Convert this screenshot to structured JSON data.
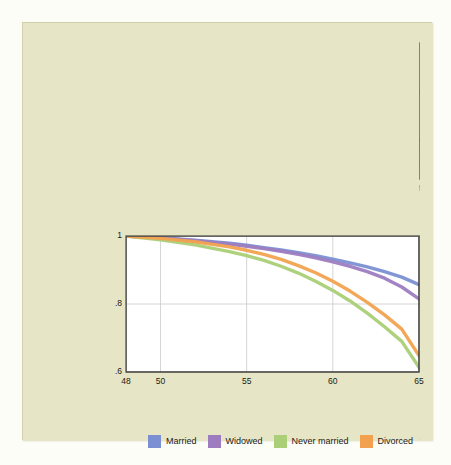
{
  "figure": {
    "background_color": "#e6e5c6",
    "panels": [
      {
        "tag": "(a) Men",
        "ylabel_line1": "Probability",
        "ylabel_line2": "of survival",
        "xlabel": "Age in years"
      },
      {
        "tag": "(b) Women",
        "ylabel_line1": "Probability",
        "ylabel_line2": "of survival",
        "xlabel": "Age in years"
      }
    ]
  },
  "legend": {
    "position": "bottom",
    "items": [
      {
        "label": "Married",
        "color": "#7b8fd2"
      },
      {
        "label": "Widowed",
        "color": "#9d7cc0"
      },
      {
        "label": "Never married",
        "color": "#aacf77"
      },
      {
        "label": "Divorced",
        "color": "#f2a24f"
      }
    ]
  },
  "chart_data": [
    {
      "type": "line",
      "title": "(a) Men",
      "xlabel": "Age in years",
      "ylabel": "Probability of survival",
      "xlim": [
        48,
        65
      ],
      "ylim": [
        0.6,
        1.0
      ],
      "xticks": [
        48,
        50,
        55,
        60,
        65
      ],
      "xtick_labels": [
        "48",
        "50",
        "55",
        "60",
        "65"
      ],
      "yticks": [
        0.6,
        0.8,
        1.0
      ],
      "ytick_labels": [
        ".6",
        ".8",
        "1"
      ],
      "grid": true,
      "x": [
        48,
        50,
        52,
        54,
        55,
        56,
        57,
        58,
        59,
        60,
        61,
        62,
        63,
        64,
        65
      ],
      "series": [
        {
          "name": "Married",
          "color": "#7b8fd2",
          "values": [
            1.0,
            0.994,
            0.986,
            0.975,
            0.968,
            0.96,
            0.952,
            0.943,
            0.933,
            0.922,
            0.91,
            0.897,
            0.884,
            0.871,
            0.859
          ]
        },
        {
          "name": "Widowed",
          "color": "#9d7cc0",
          "values": [
            1.0,
            0.992,
            0.98,
            0.964,
            0.954,
            0.942,
            0.928,
            0.912,
            0.893,
            0.871,
            0.845,
            0.817,
            0.785,
            0.75,
            0.712
          ]
        },
        {
          "name": "Never married",
          "color": "#aacf77",
          "values": [
            1.0,
            0.988,
            0.971,
            0.95,
            0.937,
            0.922,
            0.905,
            0.885,
            0.862,
            0.836,
            0.806,
            0.772,
            0.735,
            0.694,
            0.65
          ]
        },
        {
          "name": "Divorced",
          "color": "#f2a24f",
          "values": [
            1.0,
            0.991,
            0.978,
            0.961,
            0.95,
            0.937,
            0.922,
            0.904,
            0.883,
            0.859,
            0.831,
            0.8,
            0.765,
            0.727,
            0.687
          ]
        }
      ]
    },
    {
      "type": "line",
      "title": "(b) Women",
      "xlabel": "Age in years",
      "ylabel": "Probability of survival",
      "xlim": [
        48,
        65
      ],
      "ylim": [
        0.6,
        1.0
      ],
      "xticks": [
        48,
        50,
        55,
        60,
        65
      ],
      "xtick_labels": [
        "48",
        "50",
        "55",
        "60",
        "65"
      ],
      "yticks": [
        0.6,
        0.8,
        1.0
      ],
      "ytick_labels": [
        ".6",
        ".8",
        "1"
      ],
      "grid": true,
      "x": [
        48,
        50,
        52,
        54,
        55,
        56,
        57,
        58,
        59,
        60,
        61,
        62,
        63,
        64,
        65
      ],
      "series": [
        {
          "name": "Married",
          "color": "#7b8fd2",
          "values": [
            1.0,
            0.995,
            0.988,
            0.979,
            0.973,
            0.966,
            0.959,
            0.951,
            0.942,
            0.932,
            0.921,
            0.909,
            0.895,
            0.879,
            0.857
          ]
        },
        {
          "name": "Widowed",
          "color": "#9d7cc0",
          "values": [
            1.0,
            0.994,
            0.986,
            0.976,
            0.97,
            0.963,
            0.955,
            0.946,
            0.936,
            0.924,
            0.911,
            0.895,
            0.876,
            0.85,
            0.815
          ]
        },
        {
          "name": "Never married",
          "color": "#aacf77",
          "values": [
            1.0,
            0.989,
            0.974,
            0.954,
            0.942,
            0.928,
            0.911,
            0.891,
            0.867,
            0.84,
            0.809,
            0.773,
            0.733,
            0.69,
            0.614
          ]
        },
        {
          "name": "Divorced",
          "color": "#f2a24f",
          "values": [
            1.0,
            0.993,
            0.983,
            0.968,
            0.958,
            0.946,
            0.931,
            0.913,
            0.892,
            0.867,
            0.838,
            0.805,
            0.768,
            0.726,
            0.648
          ]
        }
      ]
    }
  ]
}
